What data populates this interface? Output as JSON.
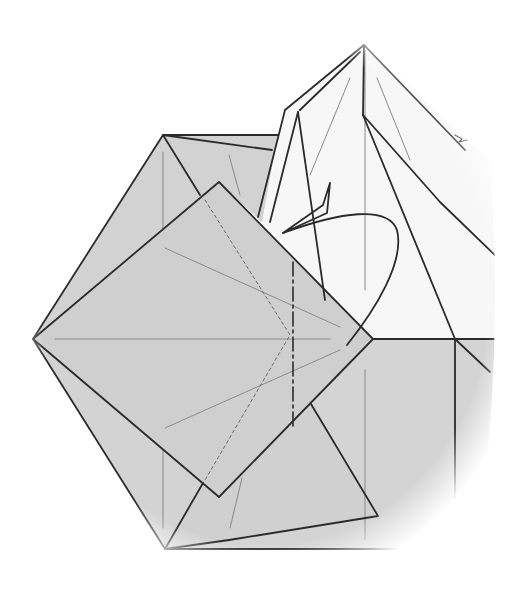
{
  "diagram": {
    "kind": "origami-fold-step",
    "canvas": {
      "width": 530,
      "height": 589
    },
    "colors": {
      "background": "#ffffff",
      "paper_colored": "#d4d4d4",
      "paper_white": "#f8f8f8",
      "crease_line": "#2b2b2b",
      "reference_line": "#8a8a8a"
    },
    "elements": {
      "base_hexagon": "colored paper base (hexagonal outline)",
      "tilted_square_flap": "colored square flap rotated 45°",
      "lower_triangle_flap": "colored triangular flap lower right",
      "white_peak_flap": "white pointed flap at top",
      "valley_fold_line": "dash-dot fold line",
      "hidden_line": "dotted hidden edge",
      "curved_arrow": "fold-direction arrow"
    }
  }
}
